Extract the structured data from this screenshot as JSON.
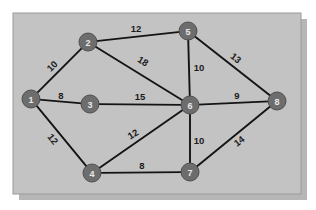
{
  "figure": {
    "canvas": {
      "width": 316,
      "height": 210
    },
    "panel": {
      "x": 13,
      "y": 13,
      "width": 288,
      "height": 181
    },
    "colors": {
      "background": "#ffffff",
      "panel_fill": "#c3c3c3",
      "panel_border": "#9a9a9a",
      "shadow": "#9d9d9d",
      "node_fill": "#6d6d6d",
      "node_stroke": "#4f4f4f",
      "node_text": "#e9e9e9",
      "edge_stroke": "#141414",
      "edge_label_text": "#1c1c1c"
    },
    "node_radius": 9,
    "edge_width": 1.9
  },
  "graph_data": {
    "type": "graph",
    "directed": false,
    "weighted": true,
    "node_count": 8,
    "edge_count": 12,
    "nodes": [
      {
        "id": "1",
        "label": "1",
        "x": 31,
        "y": 99
      },
      {
        "id": "2",
        "label": "2",
        "x": 88,
        "y": 42
      },
      {
        "id": "3",
        "label": "3",
        "x": 90,
        "y": 104
      },
      {
        "id": "4",
        "label": "4",
        "x": 92,
        "y": 173
      },
      {
        "id": "5",
        "label": "5",
        "x": 188,
        "y": 31
      },
      {
        "id": "6",
        "label": "6",
        "x": 190,
        "y": 105
      },
      {
        "id": "7",
        "label": "7",
        "x": 190,
        "y": 172
      },
      {
        "id": "8",
        "label": "8",
        "x": 277,
        "y": 101
      }
    ],
    "edges": [
      {
        "source": "1",
        "target": "2",
        "weight": 10,
        "label": "10",
        "label_x": 52,
        "label_y": 66,
        "label_rotate": -45
      },
      {
        "source": "1",
        "target": "3",
        "weight": 8,
        "label": "8",
        "label_x": 61,
        "label_y": 95,
        "label_rotate": 0
      },
      {
        "source": "1",
        "target": "4",
        "weight": 12,
        "label": "12",
        "label_x": 53,
        "label_y": 139,
        "label_rotate": 51
      },
      {
        "source": "2",
        "target": "5",
        "weight": 12,
        "label": "12",
        "label_x": 136,
        "label_y": 28,
        "label_rotate": 0
      },
      {
        "source": "2",
        "target": "6",
        "weight": 18,
        "label": "18",
        "label_x": 143,
        "label_y": 61,
        "label_rotate": 32
      },
      {
        "source": "3",
        "target": "6",
        "weight": 15,
        "label": "15",
        "label_x": 140,
        "label_y": 96,
        "label_rotate": 0
      },
      {
        "source": "4",
        "target": "6",
        "weight": 12,
        "label": "12",
        "label_x": 133,
        "label_y": 134,
        "label_rotate": -32
      },
      {
        "source": "4",
        "target": "7",
        "weight": 8,
        "label": "8",
        "label_x": 142,
        "label_y": 165,
        "label_rotate": 0
      },
      {
        "source": "5",
        "target": "6",
        "weight": 10,
        "label": "10",
        "label_x": 199,
        "label_y": 67,
        "label_rotate": 0
      },
      {
        "source": "5",
        "target": "8",
        "weight": 13,
        "label": "13",
        "label_x": 236,
        "label_y": 58,
        "label_rotate": 38
      },
      {
        "source": "6",
        "target": "7",
        "weight": 10,
        "label": "10",
        "label_x": 199,
        "label_y": 140,
        "label_rotate": 0
      },
      {
        "source": "6",
        "target": "8",
        "weight": 9,
        "label": "9",
        "label_x": 237,
        "label_y": 95,
        "label_rotate": 0
      },
      {
        "source": "7",
        "target": "8",
        "weight": 14,
        "label": "14",
        "label_x": 239,
        "label_y": 141,
        "label_rotate": -37
      }
    ]
  }
}
